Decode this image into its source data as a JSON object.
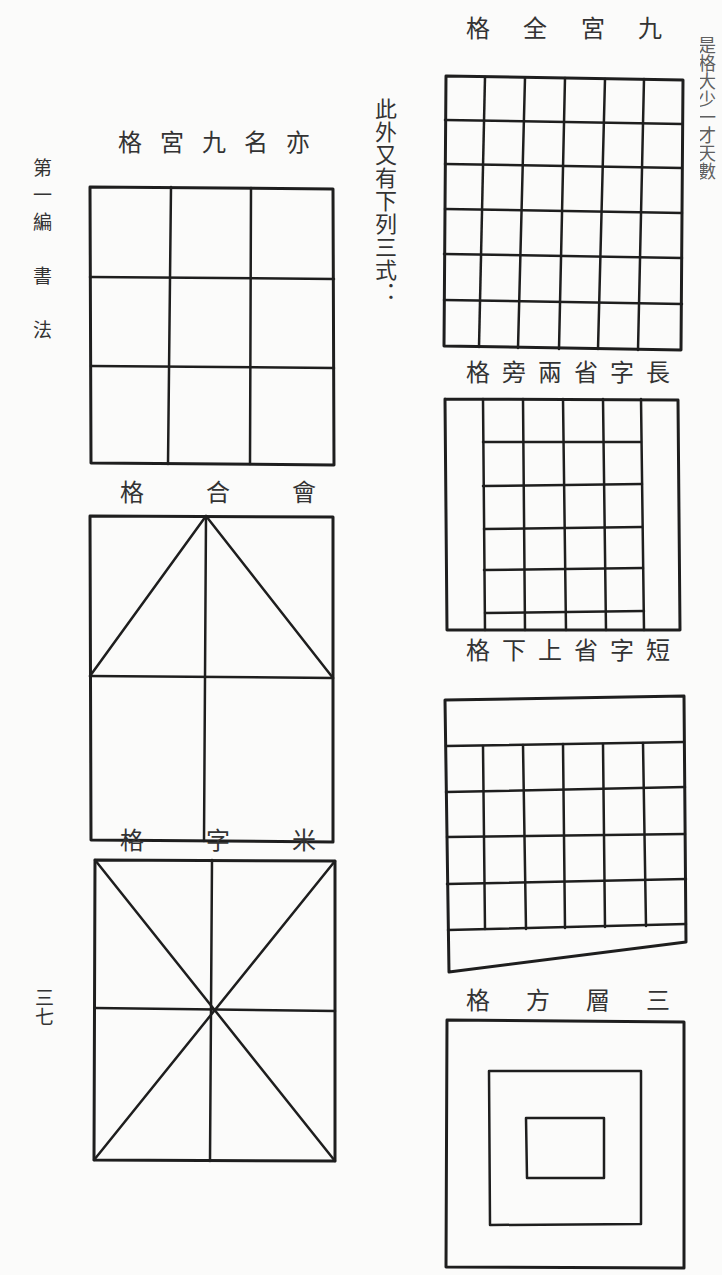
{
  "page": {
    "running_head": "第一編　書　法",
    "page_number": "三七",
    "intro_note": "此外又有下列三式："
  },
  "grids": {
    "jiugong_alt": {
      "title_chars": [
        "格",
        "宮",
        "九",
        "名",
        "亦"
      ],
      "rows": 3,
      "cols": 3
    },
    "huihe": {
      "title_chars": [
        "格",
        "合",
        "會"
      ],
      "rows": 2,
      "cols": 2
    },
    "mizi": {
      "title_chars": [
        "格",
        "字",
        "米"
      ],
      "rows": 2,
      "cols": 2
    },
    "jiugong_quan": {
      "title_chars": [
        "格",
        "全",
        "宮",
        "九"
      ],
      "rows": 6,
      "cols": 6
    },
    "changzi": {
      "title_chars": [
        "格",
        "旁",
        "兩",
        "省",
        "字",
        "長"
      ],
      "rows": 6,
      "cols": 4
    },
    "duanzi": {
      "title_chars": [
        "格",
        "下",
        "上",
        "省",
        "字",
        "短"
      ],
      "rows": 4,
      "cols": 6
    },
    "sanceng": {
      "title_chars": [
        "格",
        "方",
        "層",
        "三"
      ],
      "levels": 3
    }
  },
  "edge_fragments": [
    "是",
    "格",
    "大",
    "少",
    "一",
    "才",
    "天",
    "數",
    "",
    "目",
    "在",
    "",
    "口",
    "有",
    "口",
    "口",
    "",
    "目",
    "口",
    "大"
  ]
}
